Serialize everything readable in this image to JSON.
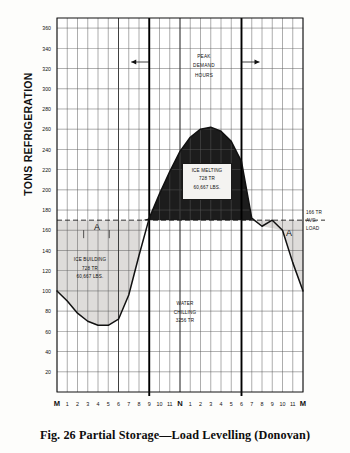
{
  "figure": {
    "caption": "Fig. 26    Partial Storage—Load Levelling (Donovan)",
    "y_axis_title": "TONS REFRIGERATION"
  },
  "annotations": {
    "peak_demand": {
      "line1": "PEAK",
      "line2": "DEMAND",
      "line3": "HOURS"
    },
    "ice_melting": {
      "line1": "ICE MELTING",
      "line2": "728 TR",
      "line3": "60,667 LBS."
    },
    "ice_building": {
      "line1": "ICE BUILDING",
      "line2": "728 TR",
      "line3": "60,667 LBS."
    },
    "water_chilling": {
      "line1": "WATER",
      "line2": "CHILLING",
      "line3": "3256 TR"
    },
    "avg_load": {
      "line1": "166 TR",
      "line2": "AVG.",
      "line3": "LOAD"
    },
    "region_a_left": "A",
    "region_a_right": "A"
  },
  "chart_data": {
    "type": "area",
    "title": "Partial Storage—Load Levelling (Donovan)",
    "xlabel": "",
    "ylabel": "TONS REFRIGERATION",
    "ylim": [
      0,
      370
    ],
    "ytick_values": [
      20,
      40,
      60,
      80,
      100,
      120,
      140,
      160,
      180,
      200,
      220,
      240,
      260,
      280,
      300,
      320,
      340,
      360
    ],
    "ytick_labels": [
      "20",
      "40",
      "60",
      "80",
      "100",
      "120",
      "140",
      "160",
      "180",
      "200",
      "220",
      "240",
      "260",
      "280",
      "300",
      "320",
      "340",
      "360"
    ],
    "grid": true,
    "xlim": [
      0,
      24
    ],
    "xtick_labels": [
      "M",
      "1",
      "2",
      "3",
      "4",
      "5",
      "6",
      "7",
      "8",
      "9",
      "10",
      "11",
      "N",
      "1",
      "2",
      "3",
      "4",
      "5",
      "6",
      "7",
      "8",
      "9",
      "10",
      "11",
      "M"
    ],
    "x_hours": [
      0,
      1,
      2,
      3,
      4,
      5,
      6,
      7,
      8,
      9,
      10,
      11,
      12,
      13,
      14,
      15,
      16,
      17,
      18,
      19,
      20,
      21,
      22,
      23,
      24
    ],
    "series": [
      {
        "name": "Building cooling load",
        "units": "TR",
        "values": [
          100,
          90,
          78,
          70,
          66,
          66,
          72,
          96,
          135,
          172,
          196,
          218,
          238,
          252,
          260,
          262,
          258,
          248,
          228,
          172,
          164,
          170,
          160,
          128,
          100
        ]
      }
    ],
    "reference_lines": [
      {
        "name": "average load",
        "value": 170,
        "label": "166 TR AVG. LOAD",
        "style": "dashed"
      }
    ],
    "peak_demand_window": {
      "start_hour": 9,
      "end_hour": 18,
      "label": "PEAK DEMAND HOURS"
    },
    "filled_regions": [
      {
        "name": "ice melting",
        "fill": "dark",
        "description": "area above average load line between 8 AM and 6 PM",
        "tons": 728,
        "pounds": "60,667"
      },
      {
        "name": "ice building",
        "fill": "light",
        "description": "area below average load line, night and early morning",
        "tons": 728,
        "pounds": "60,667"
      },
      {
        "name": "water chilling",
        "fill": "none",
        "description": "area under average load line across the day",
        "tons": 3256
      }
    ]
  },
  "colors": {
    "ice_melting_fill": "#1c1c1c",
    "ice_building_fill": "#dedcda",
    "grid": "#5a5a5a",
    "curve": "#111111",
    "background": "#fdfdfb"
  }
}
